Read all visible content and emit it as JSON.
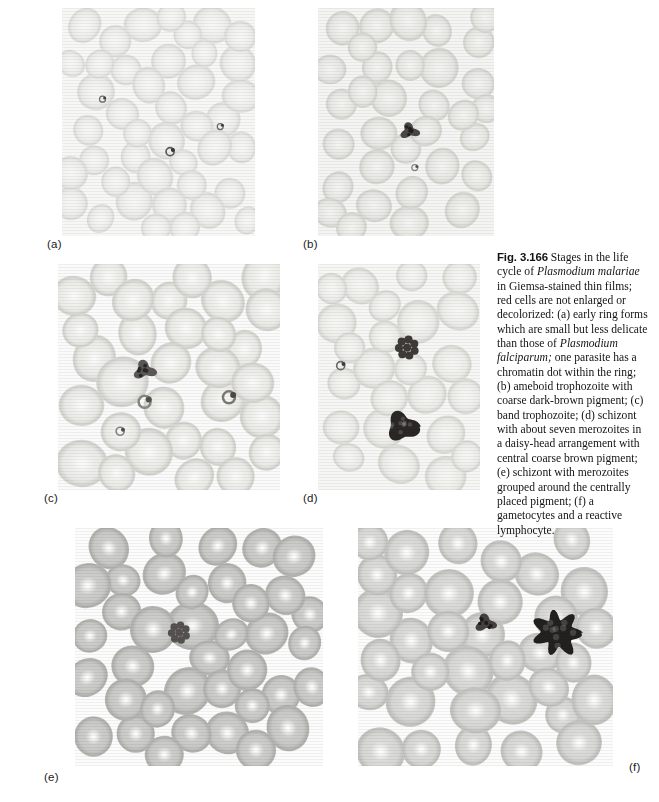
{
  "figure": {
    "number": "Fig. 3.166",
    "caption_segments": [
      {
        "text": "Fig. 3.166",
        "style": "fignum"
      },
      {
        "text": "  Stages in the life cycle of ",
        "style": "normal"
      },
      {
        "text": "Plasmodium malariae",
        "style": "italic"
      },
      {
        "text": " in Giemsa-stained thin films; red cells are not enlarged or decolorized: (a) early ring forms which are small but less delicate than those of ",
        "style": "normal"
      },
      {
        "text": "Plasmodium falciparum;",
        "style": "italic"
      },
      {
        "text": " one parasite has a chromatin dot within the ring; (b) ameboid trophozoite with coarse dark-brown pigment; (c) band trophozoite; (d) schizont with about seven merozoites in a daisy-head arrangement with central coarse brown pigment; (e) schizont with merozoites grouped around the centrally placed pigment; (f) a gametocytes and a reactive lymphocyte.",
        "style": "normal"
      }
    ],
    "caption_plaintext": "Fig. 3.166 Stages in the life cycle of Plasmodium malariae in Giemsa-stained thin films; red cells are not enlarged or decolorized: (a) early ring forms which are small but less delicate than those of Plasmodium falciparum; one parasite has a chromatin dot within the ring; (b) ameboid trophozoite with coarse dark-brown pigment; (c) band trophozoite; (d) schizont with about seven merozoites in a daisy-head arrangement with central coarse brown pigment; (e) schizont with merozoites grouped around the centrally placed pigment; (f) a gametocytes and a reactive lymphocyte."
  },
  "panels": [
    {
      "id": "a",
      "label": "(a)",
      "description": "early ring forms which are small but less delicate than those of Plasmodium falciparum; one parasite has a chromatin dot within the ring",
      "rect": {
        "x": 62,
        "y": 8,
        "width": 193,
        "height": 228
      },
      "label_pos": {
        "x": 47,
        "y": 239
      },
      "tone": "very-pale",
      "bg": "#f7f7f5",
      "cell_fill": "#ececea",
      "cell_edge": "#dcdcd8",
      "cell_radius_px": 17,
      "cell_count": 72,
      "parasites": [
        {
          "x": 0.56,
          "y": 0.63,
          "size": 4,
          "color": "#5d5a58",
          "kind": "ring-with-chromatin-dot"
        },
        {
          "x": 0.21,
          "y": 0.4,
          "size": 3,
          "color": "#70706c",
          "kind": "ring-form"
        },
        {
          "x": 0.82,
          "y": 0.52,
          "size": 3,
          "color": "#6a6a66",
          "kind": "ring-form"
        }
      ]
    },
    {
      "id": "b",
      "label": "(b)",
      "description": "ameboid trophozoite with coarse dark-brown pigment",
      "rect": {
        "x": 318,
        "y": 8,
        "width": 176,
        "height": 228
      },
      "label_pos": {
        "x": 303,
        "y": 239
      },
      "tone": "pale",
      "bg": "#f4f4f2",
      "cell_fill": "#e6e6e3",
      "cell_edge": "#d4d4cf",
      "cell_radius_px": 18,
      "cell_count": 62,
      "parasites": [
        {
          "x": 0.52,
          "y": 0.54,
          "size": 11,
          "color": "#4a4744",
          "kind": "ameboid-trophozoite"
        },
        {
          "x": 0.55,
          "y": 0.7,
          "size": 3,
          "color": "#8a8a85",
          "kind": "speck"
        }
      ]
    },
    {
      "id": "c",
      "label": "(c)",
      "description": "band trophozoite",
      "rect": {
        "x": 58,
        "y": 264,
        "width": 222,
        "height": 226
      },
      "label_pos": {
        "x": 44,
        "y": 493
      },
      "tone": "pale",
      "bg": "#fafafa",
      "cell_fill": "#e9e9e6",
      "cell_edge": "#d2d2cd",
      "cell_radius_px": 22,
      "cell_count": 52,
      "parasites": [
        {
          "x": 0.39,
          "y": 0.47,
          "size": 13,
          "color": "#5b5855",
          "kind": "band-trophozoite"
        },
        {
          "x": 0.39,
          "y": 0.61,
          "size": 6,
          "color": "#8a8781",
          "kind": "small-ring"
        },
        {
          "x": 0.77,
          "y": 0.59,
          "size": 6,
          "color": "#7d7a76",
          "kind": "speck"
        },
        {
          "x": 0.28,
          "y": 0.74,
          "size": 4,
          "color": "#88857f",
          "kind": "speck"
        }
      ]
    },
    {
      "id": "d",
      "label": "(d)",
      "description": "schizont with about seven merozoites in a daisy-head arrangement with central coarse brown pigment",
      "rect": {
        "x": 318,
        "y": 264,
        "width": 162,
        "height": 226
      },
      "label_pos": {
        "x": 303,
        "y": 493
      },
      "tone": "pale",
      "bg": "#f6f6f4",
      "cell_fill": "#ebebe8",
      "cell_edge": "#d8d8d3",
      "cell_radius_px": 19,
      "cell_count": 48,
      "parasites": [
        {
          "x": 0.55,
          "y": 0.37,
          "size": 14,
          "color": "#3e3b38",
          "kind": "daisy-head-schizont"
        },
        {
          "x": 0.52,
          "y": 0.72,
          "size": 17,
          "color": "#2a2724",
          "kind": "dark-segmented-cell"
        },
        {
          "x": 0.14,
          "y": 0.45,
          "size": 4,
          "color": "#6e6b67",
          "kind": "speck"
        }
      ]
    },
    {
      "id": "e",
      "label": "(e)",
      "description": "schizont with merozoites grouped around the centrally placed pigment",
      "rect": {
        "x": 75,
        "y": 528,
        "width": 248,
        "height": 238
      },
      "label_pos": {
        "x": 44,
        "y": 772
      },
      "tone": "medium",
      "bg": "#fcfcfc",
      "cell_fill": "#c8c8c6",
      "cell_edge": "#b0b0ad",
      "cell_radius_px": 21,
      "cell_count": 64,
      "parasites": [
        {
          "x": 0.42,
          "y": 0.44,
          "size": 13,
          "color": "#55524f",
          "kind": "schizont"
        }
      ]
    },
    {
      "id": "f",
      "label": "(f)",
      "description": "a gametocytes and a reactive lymphocyte",
      "rect": {
        "x": 358,
        "y": 528,
        "width": 255,
        "height": 238
      },
      "label_pos": {
        "x": 629,
        "y": 762
      },
      "tone": "medium",
      "bg": "#fcfcfc",
      "cell_fill": "#d6d6d4",
      "cell_edge": "#c0c0bd",
      "cell_radius_px": 22,
      "cell_count": 58,
      "parasites": [
        {
          "x": 0.5,
          "y": 0.4,
          "size": 12,
          "color": "#44413e",
          "kind": "gametocyte"
        },
        {
          "x": 0.78,
          "y": 0.44,
          "size": 24,
          "color": "#23211f",
          "kind": "reactive-lymphocyte"
        }
      ]
    }
  ],
  "colors": {
    "page_background": "#ffffff",
    "caption_text": "#131313",
    "label_text": "#1a1a1a"
  }
}
